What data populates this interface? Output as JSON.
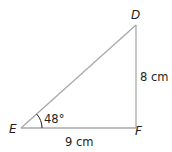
{
  "diagram": {
    "type": "right-triangle",
    "vertices": [
      {
        "name": "D",
        "x": 136,
        "y": 25
      },
      {
        "name": "E",
        "x": 21,
        "y": 128
      },
      {
        "name": "F",
        "x": 136,
        "y": 128
      }
    ],
    "labels": {
      "vertex_d": "D",
      "vertex_e": "E",
      "vertex_f": "F",
      "side_df": "8 cm",
      "side_ef": "9 cm",
      "angle_e": "48°"
    },
    "colors": {
      "line": "#a7a9ac",
      "text": "#231f20"
    }
  }
}
